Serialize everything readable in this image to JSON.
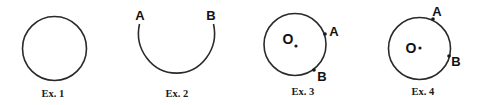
{
  "examples": [
    {
      "caption": "Ex. 1",
      "description": "full circle"
    },
    {
      "caption": "Ex. 2",
      "description": "arc from A to B",
      "labels": {
        "a": "A",
        "b": "B"
      }
    },
    {
      "caption": "Ex. 3",
      "description": "circle with center O and points A, B on the right side",
      "labels": {
        "o": "O",
        "a": "A",
        "b": "B"
      }
    },
    {
      "caption": "Ex. 4",
      "description": "circle with center O and points A (top-right), B (right)",
      "labels": {
        "o": "O",
        "a": "A",
        "b": "B"
      }
    }
  ],
  "colors": {
    "stroke": "#2a2a2a",
    "text": "#111111",
    "background": "#ffffff"
  }
}
